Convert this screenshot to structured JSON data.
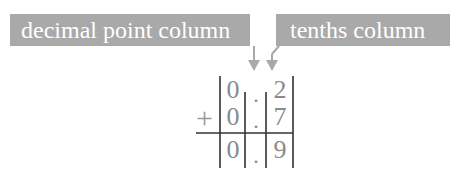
{
  "labels": {
    "decimal_point_column": "decimal point column",
    "tenths_column": "tenths column"
  },
  "colors": {
    "label_background": "#a9a9a9",
    "label_text": "#ffffff",
    "arrow": "#a9a9a9",
    "digits": "#8a8a8a",
    "grid_lines": "#333333"
  },
  "addition": {
    "operator": "+",
    "decimal_point": ".",
    "rows": [
      {
        "ones": "0",
        "tenths": "2"
      },
      {
        "ones": "0",
        "tenths": "7"
      },
      {
        "ones": "0",
        "tenths": "9"
      }
    ]
  }
}
